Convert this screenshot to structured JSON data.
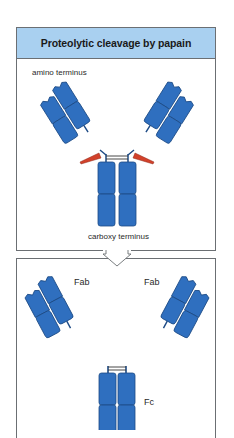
{
  "diagram": {
    "title": "Proteolytic cleavage by papain",
    "labels": {
      "amino_terminus": "amino terminus",
      "carboxy_terminus": "carboxy terminus",
      "fab_left": "Fab",
      "fab_right": "Fab",
      "fc": "Fc"
    },
    "colors": {
      "header_background": "#a9d0f0",
      "domain_blue": "#2f6fbf",
      "domain_outline": "#1c4a85",
      "cleavage_red": "#d2412a",
      "border_gray": "#6b6f73"
    },
    "steps": [
      {
        "name": "intact-antibody",
        "description": "Y-shaped IgG with papain cleavage sites at the hinge"
      },
      {
        "name": "cleaved-products",
        "description": "Two Fab fragments and one Fc fragment"
      }
    ],
    "arrow": "down-arrow"
  }
}
